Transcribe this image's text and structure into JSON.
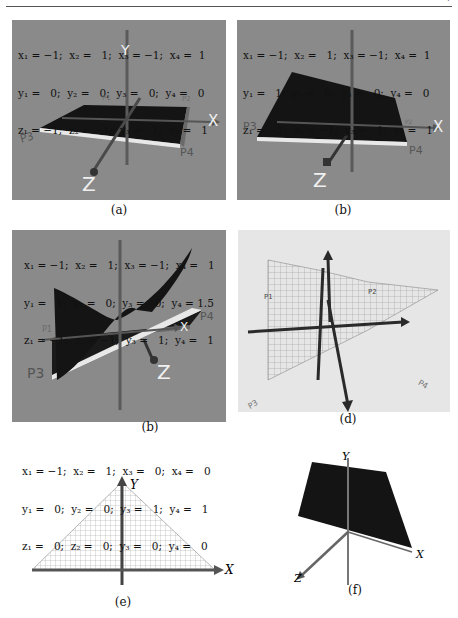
{
  "page": {
    "header_mark": "7"
  },
  "panels": [
    {
      "id": "a",
      "caption": "(a)",
      "equations": [
        "x₁ = −1;  x₂ =   1;  x₃ = −1;  x₄ =  1",
        "y₁ =   0;  y₂ =   0;  y₃ =   0;  y₄ =   0",
        "z₁ = −1;  z₂ = −1;  y₃ =   1;  y₄ =   1"
      ],
      "point_labels": [
        "P1",
        "P2",
        "P3",
        "P4"
      ],
      "axis_labels": [
        "X",
        "Y",
        "Z"
      ]
    },
    {
      "id": "b",
      "caption": "(b)",
      "equations": [
        "x₁ = −1;  x₂ =   1;  x₃ = −1;  x₄ =  1",
        "y₁ =   1;  y₂ =   0;  y₃ =   0;  y₄ =   0",
        "z₁ = −1;  z₂ = −1;  y₃ =   1;  y₄ =   1"
      ],
      "point_labels": [
        "P2",
        "P3",
        "P4"
      ],
      "axis_labels": [
        "X",
        "Y",
        "Z"
      ]
    },
    {
      "id": "c",
      "caption": "(b)",
      "equations": [
        "x₁ = −1;  x₂ =   1;  x₃ = −1;  x₄ =   1",
        "y₁ =   1;  y₂ =   0;  y₃ =   0;  y₄ = 1.5",
        "z₁ = −1;  z₂ = −1;  y₃ =   1;  y₄ =   1"
      ],
      "point_labels": [
        "P1",
        "P3",
        "P4"
      ],
      "axis_labels": [
        "X",
        "Y",
        "Z"
      ]
    },
    {
      "id": "d",
      "caption": "(d)",
      "point_labels": [
        "P1",
        "P2",
        "P3",
        "P4"
      ]
    },
    {
      "id": "e",
      "caption": "(e)",
      "equations": [
        "x₁ = −1;  x₂ =   1;  x₃ =   0;  x₄ =   0",
        "y₁ =   0;  y₂ =   0;  y₃ =   1;  y₄ =   1",
        "z₁ =   0;  z₂ =   0;  y₃ =   0;  y₄ =   0"
      ],
      "axis_labels": [
        "X",
        "Y"
      ]
    },
    {
      "id": "f",
      "caption": "(f)",
      "axis_labels": [
        "X",
        "Y",
        "Z"
      ]
    }
  ],
  "colors": {
    "panel_bg": "#8a8a8a",
    "surface": "#111111",
    "axis": "#555555",
    "label_white": "#f0f0f0"
  }
}
